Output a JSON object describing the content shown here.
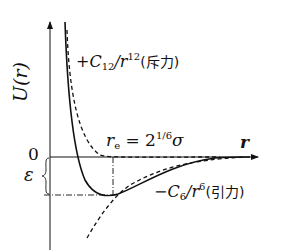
{
  "diagram": {
    "y_axis_label": "U(r)",
    "x_axis_label": "r",
    "zero_label": "0",
    "epsilon_label": "ε",
    "repulsive": {
      "prefix": "+C",
      "sub": "12",
      "mid": "/r",
      "sup": "12",
      "suffix": "(斥力)"
    },
    "attractive": {
      "prefix": "−C",
      "sub": "6",
      "mid": "/r",
      "sup": "6",
      "suffix": "(引力)"
    },
    "equilibrium": {
      "prefix": "r",
      "sub": "e",
      "mid": " = 2",
      "sup": "1/6",
      "suffix": "σ"
    },
    "colors": {
      "line": "#111111",
      "background": "#ffffff"
    }
  }
}
